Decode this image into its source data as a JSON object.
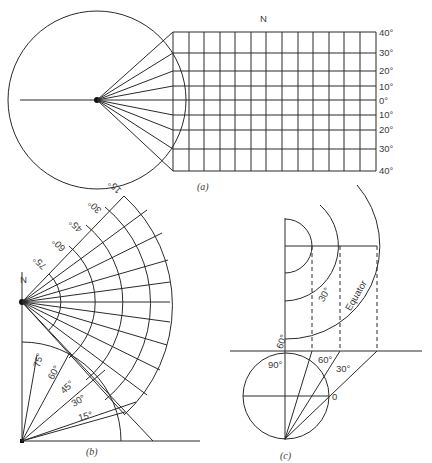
{
  "figure": {
    "panel_a": {
      "caption": "(a)",
      "north_label": "N",
      "latitude_labels": [
        "40°",
        "30°",
        "20°",
        "10°",
        "0°",
        "10°",
        "20°",
        "30°",
        "40°"
      ],
      "latitude_y": [
        32,
        53,
        71,
        86,
        100,
        115,
        130,
        149,
        171
      ],
      "grid_columns": 13
    },
    "panel_b": {
      "caption": "(b)",
      "north_label": "N",
      "upper_fan_labels": [
        "75°",
        "60°",
        "45°",
        "30°",
        "15°"
      ],
      "lower_fan_labels": [
        "75°",
        "60°",
        "45°",
        "30°",
        "15°"
      ]
    },
    "panel_c": {
      "caption": "(c)",
      "arc_labels": [
        "60°",
        "30°",
        "Equator"
      ],
      "circle_labels": [
        "90°",
        "60°",
        "30°",
        "0"
      ]
    }
  }
}
